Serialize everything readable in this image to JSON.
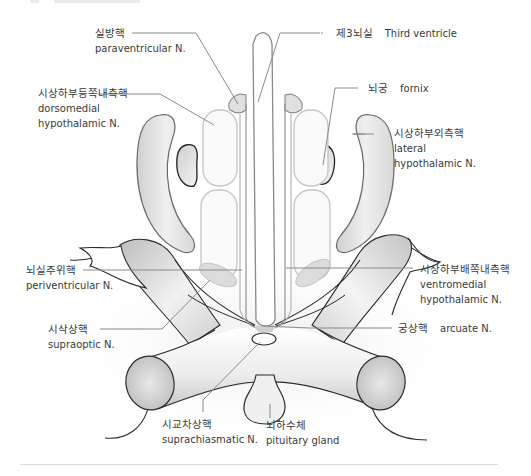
{
  "figure": {
    "title_cut_off": "",
    "colors": {
      "outline_dark": "#2b2b2b",
      "outline_light": "#b8b8b8",
      "fill_grey": "#d6d6d6",
      "leader_line": "#8a8a8a",
      "text": "#3a3a3a"
    }
  },
  "labels": [
    {
      "id": "paraventricular",
      "ko": "실방핵",
      "en": "paraventricular N."
    },
    {
      "id": "third-ventricle",
      "ko": "제3뇌실",
      "en": "Third ventricle"
    },
    {
      "id": "dorsomedial",
      "ko": "시상하부등쪽내측핵",
      "en": "dorsomedial",
      "en2": "hypothalamic N."
    },
    {
      "id": "fornix",
      "ko": "뇌궁",
      "en": "fornix"
    },
    {
      "id": "lateral",
      "ko": "시상하부외측핵",
      "en": "lateral",
      "en2": "hypothalamic N."
    },
    {
      "id": "periventricular",
      "ko": "뇌실주위핵",
      "en": "periventricular N."
    },
    {
      "id": "ventromedial",
      "ko": "시상하부배쪽내측핵",
      "en": "ventromedial",
      "en2": "hypothalamic N."
    },
    {
      "id": "supraoptic",
      "ko": "시삭상핵",
      "en": "supraoptic N."
    },
    {
      "id": "arcuate",
      "ko": "궁상핵",
      "en": "arcuate N."
    },
    {
      "id": "suprachiasmatic",
      "ko": "시교차상핵",
      "en": "suprachiasmatic N."
    },
    {
      "id": "pituitary",
      "ko": "뇌하수체",
      "en": "pituitary gland"
    }
  ]
}
